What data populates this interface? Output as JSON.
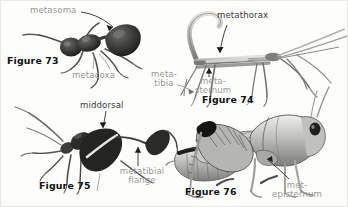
{
  "plate": {
    "title": "Metathoracic and metasomal structures of insects",
    "background_color": "#fdfdfc",
    "label_gray": "#9a9a98",
    "label_dark": "#3a3a3a",
    "fignum_color": "#111111"
  },
  "figures": [
    {
      "id": "figure-73",
      "number_label": "Figure 73",
      "subject": "ant",
      "labels": [
        {
          "name": "metasoma",
          "text": "metasoma",
          "tone": "gray"
        },
        {
          "name": "metacoxa",
          "text": "metacoxa",
          "tone": "gray"
        }
      ]
    },
    {
      "id": "figure-74",
      "number_label": "Figure 74",
      "subject": "walkingstick",
      "labels": [
        {
          "name": "metathorax",
          "text": "metathorax",
          "tone": "dark"
        },
        {
          "name": "meta-tibia",
          "text": "meta-\ntibia",
          "tone": "gray"
        },
        {
          "name": "meta-sternum",
          "text": "meta-\nsternum",
          "tone": "gray"
        }
      ]
    },
    {
      "id": "figure-75",
      "number_label": "Figure 75",
      "subject": "leaf-footed-bug",
      "labels": [
        {
          "name": "middorsal",
          "text": "middorsal",
          "tone": "dark"
        },
        {
          "name": "metatibial-flange",
          "text": "metatibial\nflange",
          "tone": "gray"
        }
      ]
    },
    {
      "id": "figure-76",
      "number_label": "Figure 76",
      "subject": "grasshopper",
      "labels": [
        {
          "name": "met-episternum",
          "text": "met-\nepisternum",
          "tone": "gray"
        }
      ]
    }
  ]
}
